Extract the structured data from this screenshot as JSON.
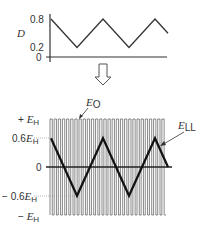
{
  "top_plot": {
    "y_symbol": "D",
    "ticks": [
      {
        "label": "0.8",
        "value": 0.8
      },
      {
        "label": "0.2",
        "value": 0.2
      },
      {
        "label": "0",
        "value": 0
      }
    ],
    "duty_cycle_points": [
      [
        0,
        0.8
      ],
      [
        1,
        0.2
      ],
      [
        2,
        0.8
      ],
      [
        3,
        0.2
      ],
      [
        4,
        0.8
      ],
      [
        4.5,
        0.5
      ]
    ]
  },
  "arrow": {
    "direction": "down",
    "style": "hollow"
  },
  "bottom_plot": {
    "ticks": [
      {
        "prefix": "+ ",
        "coef": "",
        "sym": "E",
        "sub": "H",
        "value": 1
      },
      {
        "prefix": "",
        "coef": "0.6",
        "sym": "E",
        "sub": "H",
        "value": 0.6
      },
      {
        "prefix": "",
        "coef": "0",
        "sym": "",
        "sub": "",
        "value": 0
      },
      {
        "prefix": "− ",
        "coef": "0.6",
        "sym": "E",
        "sub": "H",
        "value": -0.6
      },
      {
        "prefix": "− ",
        "coef": "",
        "sym": "E",
        "sub": "H",
        "value": -1
      }
    ],
    "pulse_label": {
      "sym": "E",
      "sub": "O"
    },
    "envelope_label": {
      "sym": "E",
      "sub": "LL"
    },
    "pulse_count": 28,
    "envelope_points": [
      [
        0,
        0.6
      ],
      [
        1,
        -0.6
      ],
      [
        2,
        0.6
      ],
      [
        3,
        -0.6
      ],
      [
        4,
        0.6
      ],
      [
        4.5,
        0
      ]
    ]
  },
  "chart_data": [
    {
      "type": "line",
      "title": "",
      "xlabel": "",
      "ylabel": "D",
      "yticks": [
        0,
        0.2,
        0.8
      ],
      "series": [
        {
          "name": "D",
          "x": [
            0,
            1,
            2,
            3,
            4,
            4.5
          ],
          "values": [
            0.8,
            0.2,
            0.8,
            0.2,
            0.8,
            0.5
          ]
        }
      ]
    },
    {
      "type": "line",
      "title": "",
      "xlabel": "",
      "ylabel": "",
      "yticks": [
        "-E_H",
        "-0.6E_H",
        "0",
        "0.6E_H",
        "+E_H"
      ],
      "series": [
        {
          "name": "E_O",
          "description": "bipolar PWM pulse train between +E_H and -E_H",
          "pulses": 28
        },
        {
          "name": "E_LL",
          "x": [
            0,
            1,
            2,
            3,
            4,
            4.5
          ],
          "values": [
            0.6,
            -0.6,
            0.6,
            -0.6,
            0.6,
            0
          ]
        }
      ]
    }
  ]
}
